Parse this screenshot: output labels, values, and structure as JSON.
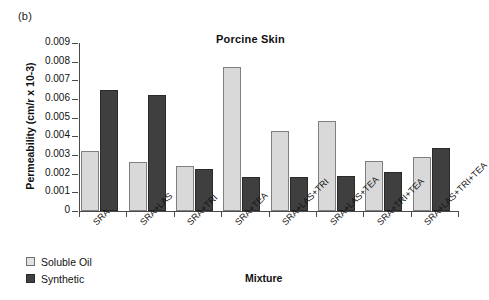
{
  "figure": {
    "panel_letter": "(b)",
    "title": "Porcine Skin",
    "xlabel": "Mixture",
    "ylabel": "Permeability (cm/r x 10-3)"
  },
  "legend": {
    "items": [
      {
        "label": "Soluble Oil",
        "color": "#d9d9d9",
        "name": "soluble-oil"
      },
      {
        "label": "Synthetic",
        "color": "#3f3f3f",
        "name": "synthetic"
      }
    ]
  },
  "axis": {
    "y_ticks": [
      "0.009",
      "0.008",
      "0.007",
      "0.006",
      "0.005",
      "0.004",
      "0.003",
      "0.002",
      "0.001",
      "0"
    ],
    "y_min": 0,
    "y_max": 0.009
  },
  "chart_data": {
    "type": "bar",
    "title": "Porcine Skin",
    "xlabel": "Mixture",
    "ylabel": "Permeability (cm/r x 10-3)",
    "ylim": [
      0,
      0.009
    ],
    "ytick_values": [
      0,
      0.001,
      0.002,
      0.003,
      0.004,
      0.005,
      0.006,
      0.007,
      0.008,
      0.009
    ],
    "grid": false,
    "legend_position": "below-left",
    "categories": [
      "SRA",
      "SRA+LAS",
      "SRA+TRI",
      "SRA+TEA",
      "SRA+LAS+TRI",
      "SRA+LAS+TEA",
      "SRA+TRI+TEA",
      "SRA+LAS+TRI+TEA"
    ],
    "series": [
      {
        "name": "Soluble Oil",
        "color": "#d9d9d9",
        "values": [
          0.0032,
          0.0026,
          0.0024,
          0.0077,
          0.0043,
          0.0048,
          0.0027,
          0.0029
        ]
      },
      {
        "name": "Synthetic",
        "color": "#3f3f3f",
        "values": [
          0.0065,
          0.0062,
          0.00225,
          0.0018,
          0.0018,
          0.0019,
          0.0021,
          0.0034
        ]
      }
    ]
  }
}
